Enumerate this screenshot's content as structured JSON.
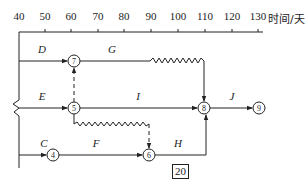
{
  "axis": {
    "unit_label": "时间/天",
    "ticks": [
      {
        "label": "40",
        "x": 19
      },
      {
        "label": "50",
        "x": 45
      },
      {
        "label": "60",
        "x": 71
      },
      {
        "label": "70",
        "x": 98
      },
      {
        "label": "80",
        "x": 124
      },
      {
        "label": "90",
        "x": 151
      },
      {
        "label": "100",
        "x": 178
      },
      {
        "label": "110",
        "x": 205
      },
      {
        "label": "120",
        "x": 232
      },
      {
        "label": "130",
        "x": 258
      }
    ]
  },
  "nodes": [
    {
      "id": "7",
      "x": 74,
      "y": 61
    },
    {
      "id": "5",
      "x": 74,
      "y": 108
    },
    {
      "id": "8",
      "x": 204,
      "y": 108
    },
    {
      "id": "9",
      "x": 259,
      "y": 108
    },
    {
      "id": "4",
      "x": 53,
      "y": 155
    },
    {
      "id": "6",
      "x": 149,
      "y": 155
    }
  ],
  "activities": [
    {
      "name": "D",
      "x": 42,
      "y": 43
    },
    {
      "name": "G",
      "x": 112,
      "y": 43
    },
    {
      "name": "E",
      "x": 42,
      "y": 90
    },
    {
      "name": "I",
      "x": 138,
      "y": 90
    },
    {
      "name": "J",
      "x": 232,
      "y": 90
    },
    {
      "name": "C",
      "x": 42,
      "y": 137
    },
    {
      "name": "F",
      "x": 96,
      "y": 137
    },
    {
      "name": "H",
      "x": 178,
      "y": 137
    }
  ],
  "boxed_value": "20",
  "line_color": "#222222"
}
